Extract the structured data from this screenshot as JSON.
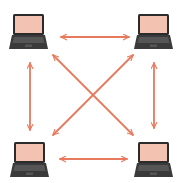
{
  "diagram": {
    "type": "full-mesh-network",
    "node_count": 4,
    "colors": {
      "background": "#ffffff",
      "arrow": "#e8795c",
      "laptop_body": "#3a3a3a",
      "laptop_bezel": "#2b2b2b",
      "laptop_screen": "#f4c2b0",
      "laptop_keyboard": "#555555"
    },
    "nodes": [
      {
        "id": "top-left",
        "icon": "laptop-icon",
        "x": 13,
        "y": 14
      },
      {
        "id": "top-right",
        "icon": "laptop-icon",
        "x": 138,
        "y": 14
      },
      {
        "id": "bottom-left",
        "icon": "laptop-icon",
        "x": 14,
        "y": 142
      },
      {
        "id": "bottom-right",
        "icon": "laptop-icon",
        "x": 138,
        "y": 142
      }
    ],
    "connections": [
      {
        "id": "top",
        "from": "top-left",
        "to": "top-right",
        "bidirectional": true,
        "x1": 61,
        "y1": 37,
        "x2": 129,
        "y2": 37
      },
      {
        "id": "bottom",
        "from": "bottom-left",
        "to": "bottom-right",
        "bidirectional": true,
        "x1": 60,
        "y1": 159,
        "x2": 127,
        "y2": 159
      },
      {
        "id": "left",
        "from": "top-left",
        "to": "bottom-left",
        "bidirectional": true,
        "x1": 30,
        "y1": 63,
        "x2": 30,
        "y2": 130
      },
      {
        "id": "right",
        "from": "top-right",
        "to": "bottom-right",
        "bidirectional": true,
        "x1": 154,
        "y1": 63,
        "x2": 154,
        "y2": 128
      },
      {
        "id": "diag-down",
        "from": "top-left",
        "to": "bottom-right",
        "bidirectional": true,
        "x1": 53,
        "y1": 55,
        "x2": 133,
        "y2": 135
      },
      {
        "id": "diag-up",
        "from": "bottom-left",
        "to": "top-right",
        "bidirectional": true,
        "x1": 53,
        "y1": 135,
        "x2": 133,
        "y2": 55
      }
    ]
  }
}
